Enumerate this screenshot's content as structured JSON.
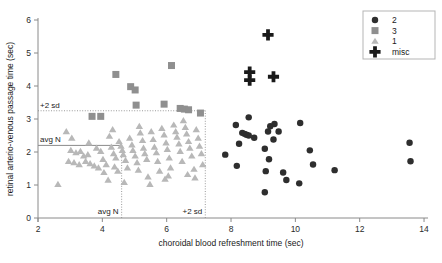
{
  "chart_data": {
    "type": "scatter",
    "title": "",
    "xlabel": "choroidal blood refreshment time (sec)",
    "ylabel": "retinal arterio-venous passage time (sec)",
    "xlim": [
      2,
      14
    ],
    "ylim": [
      0,
      6
    ],
    "xticks": [
      2,
      4,
      6,
      8,
      10,
      12,
      14
    ],
    "yticks": [
      0,
      1,
      2,
      3,
      4,
      5,
      6
    ],
    "xtick_labels": [
      "2",
      "4",
      "6",
      "8",
      "10",
      "12",
      "14"
    ],
    "ytick_labels": [
      "0",
      "1",
      "2",
      "3",
      "4",
      "5",
      "6"
    ],
    "grid": false,
    "legend_position": "top-right",
    "annotations": [
      {
        "name": "y-avg-n",
        "label": "avg N",
        "orientation": "horizontal",
        "value": 2.2,
        "style": "solid",
        "x_start": 2.0,
        "x_end": 4.6
      },
      {
        "name": "y-plus-2sd",
        "label": "+2 sd",
        "orientation": "horizontal",
        "value": 3.25,
        "style": "dotted",
        "x_start": 2.0,
        "x_end": 7.2
      },
      {
        "name": "x-avg-n",
        "label": "avg N",
        "orientation": "vertical",
        "value": 4.6,
        "style": "dotted",
        "y_start": 0.0,
        "y_end": 2.2
      },
      {
        "name": "x-plus-2sd",
        "label": "+2 sd",
        "orientation": "vertical",
        "value": 7.2,
        "style": "dotted",
        "y_start": 0.0,
        "y_end": 3.25
      }
    ],
    "series": [
      {
        "name": "2",
        "marker": "circle",
        "color": "#2e2e2e",
        "points": [
          [
            8.55,
            3.05
          ],
          [
            8.15,
            2.82
          ],
          [
            8.35,
            2.58
          ],
          [
            8.42,
            2.55
          ],
          [
            8.48,
            2.52
          ],
          [
            8.55,
            2.5
          ],
          [
            8.72,
            2.43
          ],
          [
            8.25,
            2.25
          ],
          [
            7.82,
            1.92
          ],
          [
            8.18,
            1.58
          ],
          [
            9.22,
            2.78
          ],
          [
            9.15,
            2.62
          ],
          [
            9.35,
            2.85
          ],
          [
            9.48,
            2.62
          ],
          [
            9.32,
            2.38
          ],
          [
            9.05,
            2.1
          ],
          [
            9.18,
            1.78
          ],
          [
            9.08,
            1.42
          ],
          [
            9.62,
            1.38
          ],
          [
            9.72,
            1.15
          ],
          [
            10.15,
            2.88
          ],
          [
            10.45,
            2.05
          ],
          [
            10.55,
            1.62
          ],
          [
            11.22,
            1.45
          ],
          [
            10.12,
            1.05
          ],
          [
            9.05,
            0.78
          ],
          [
            13.55,
            2.28
          ],
          [
            13.58,
            1.72
          ]
        ]
      },
      {
        "name": "3",
        "marker": "square",
        "color": "#8f8f8f",
        "points": [
          [
            4.42,
            4.35
          ],
          [
            4.88,
            3.98
          ],
          [
            5.02,
            3.88
          ],
          [
            6.15,
            4.62
          ],
          [
            5.05,
            3.42
          ],
          [
            5.92,
            3.45
          ],
          [
            6.42,
            3.32
          ],
          [
            6.55,
            3.3
          ],
          [
            6.68,
            3.28
          ],
          [
            7.05,
            3.18
          ],
          [
            3.68,
            3.08
          ],
          [
            3.95,
            3.08
          ]
        ]
      },
      {
        "name": "1",
        "marker": "triangle",
        "color": "#b8b8b8",
        "points": [
          [
            2.62,
            1.02
          ],
          [
            2.88,
            2.62
          ],
          [
            3.02,
            2.05
          ],
          [
            3.18,
            1.98
          ],
          [
            3.32,
            2.02
          ],
          [
            3.42,
            1.88
          ],
          [
            3.55,
            1.92
          ],
          [
            3.48,
            1.72
          ],
          [
            3.62,
            1.65
          ],
          [
            3.75,
            1.58
          ],
          [
            3.88,
            1.52
          ],
          [
            3.82,
            2.12
          ],
          [
            3.95,
            2.02
          ],
          [
            4.02,
            1.78
          ],
          [
            4.12,
            1.62
          ],
          [
            4.05,
            1.38
          ],
          [
            4.22,
            2.48
          ],
          [
            4.28,
            2.15
          ],
          [
            4.35,
            1.95
          ],
          [
            4.42,
            1.82
          ],
          [
            4.38,
            1.55
          ],
          [
            4.48,
            1.42
          ],
          [
            4.52,
            2.32
          ],
          [
            4.58,
            2.18
          ],
          [
            4.62,
            2.05
          ],
          [
            4.65,
            1.92
          ],
          [
            4.72,
            1.75
          ],
          [
            4.78,
            1.52
          ],
          [
            4.85,
            2.42
          ],
          [
            4.92,
            2.22
          ],
          [
            4.95,
            2.05
          ],
          [
            5.02,
            1.88
          ],
          [
            5.08,
            1.68
          ],
          [
            5.12,
            1.45
          ],
          [
            5.18,
            2.58
          ],
          [
            5.25,
            2.35
          ],
          [
            5.28,
            2.12
          ],
          [
            5.32,
            1.95
          ],
          [
            5.38,
            1.78
          ],
          [
            5.42,
            1.25
          ],
          [
            5.52,
            2.62
          ],
          [
            5.58,
            2.38
          ],
          [
            5.62,
            2.15
          ],
          [
            5.68,
            1.98
          ],
          [
            5.72,
            1.72
          ],
          [
            5.78,
            1.42
          ],
          [
            5.85,
            2.72
          ],
          [
            5.92,
            2.52
          ],
          [
            5.98,
            2.28
          ],
          [
            6.02,
            2.08
          ],
          [
            6.08,
            1.82
          ],
          [
            6.12,
            1.52
          ],
          [
            6.22,
            2.82
          ],
          [
            6.28,
            2.62
          ],
          [
            6.32,
            2.45
          ],
          [
            6.38,
            2.25
          ],
          [
            6.42,
            2.02
          ],
          [
            6.48,
            1.72
          ],
          [
            6.52,
            2.95
          ],
          [
            6.58,
            2.75
          ],
          [
            6.62,
            2.55
          ],
          [
            6.68,
            2.32
          ],
          [
            6.72,
            2.12
          ],
          [
            6.78,
            1.88
          ],
          [
            6.85,
            1.48
          ],
          [
            6.92,
            2.68
          ],
          [
            6.98,
            2.42
          ],
          [
            7.02,
            2.18
          ],
          [
            7.08,
            1.95
          ],
          [
            7.12,
            1.62
          ],
          [
            2.95,
            1.72
          ],
          [
            3.12,
            1.68
          ],
          [
            3.28,
            1.62
          ],
          [
            4.18,
            1.15
          ],
          [
            4.68,
            1.08
          ],
          [
            5.48,
            1.02
          ],
          [
            6.05,
            1.28
          ],
          [
            6.65,
            1.32
          ],
          [
            3.05,
            2.42
          ],
          [
            3.58,
            2.28
          ],
          [
            4.32,
            2.68
          ],
          [
            5.15,
            2.78
          ],
          [
            5.95,
            1.18
          ],
          [
            6.88,
            1.22
          ]
        ]
      },
      {
        "name": "misc",
        "marker": "plus",
        "color": "#1a1a1a",
        "points": [
          [
            9.15,
            5.55
          ],
          [
            8.58,
            4.42
          ],
          [
            8.58,
            4.18
          ],
          [
            9.32,
            4.28
          ]
        ]
      }
    ],
    "legend": [
      {
        "label": "2",
        "marker": "circle",
        "color": "#2e2e2e"
      },
      {
        "label": "3",
        "marker": "square",
        "color": "#8f8f8f"
      },
      {
        "label": "1",
        "marker": "triangle",
        "color": "#b8b8b8"
      },
      {
        "label": "misc",
        "marker": "plus",
        "color": "#1a1a1a"
      }
    ]
  }
}
